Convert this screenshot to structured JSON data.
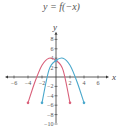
{
  "title": "y = f(−x)",
  "chart_data": {
    "type": "line",
    "title": "y = f(−x)",
    "xlabel": "x",
    "ylabel": "y",
    "xlim": [
      -7,
      7
    ],
    "ylim": [
      -11,
      9
    ],
    "x_ticks": [
      -6,
      -4,
      -2,
      2,
      4,
      6
    ],
    "y_ticks": [
      8,
      6,
      4,
      2,
      -2,
      -4,
      -6,
      -8,
      -10
    ],
    "grid": false,
    "series": [
      {
        "name": "y = f(-x)",
        "color": "#d9607a",
        "points": [
          [
            -4,
            -5.5
          ],
          [
            -3,
            -1
          ],
          [
            -2,
            2.5
          ],
          [
            -1,
            4
          ],
          [
            0,
            3.5
          ],
          [
            1,
            1.5
          ],
          [
            2,
            -5.5
          ]
        ],
        "marked_points": [
          [
            -4,
            -5.5
          ],
          [
            0,
            3.5
          ],
          [
            2,
            -5.5
          ]
        ]
      },
      {
        "name": "y = f(x)",
        "color": "#4aa8cc",
        "points": [
          [
            -2,
            -5.5
          ],
          [
            -1,
            1.5
          ],
          [
            0,
            3.5
          ],
          [
            1,
            4
          ],
          [
            2,
            2.5
          ],
          [
            3,
            -1
          ],
          [
            4,
            -5.5
          ]
        ],
        "marked_points": [
          [
            -2,
            -5.5
          ],
          [
            0,
            3.5
          ],
          [
            4,
            -5.5
          ]
        ]
      }
    ]
  }
}
